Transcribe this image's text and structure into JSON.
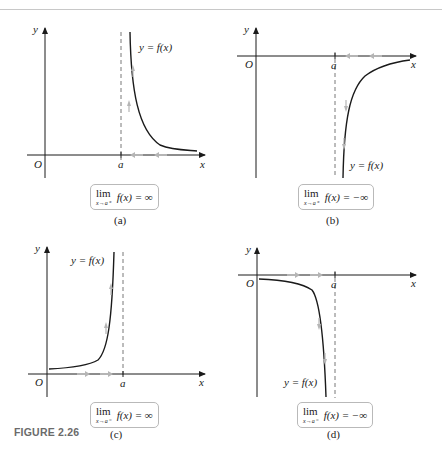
{
  "figure": {
    "label": "FIGURE 2.26",
    "label_color": "#6b6b6b",
    "curve_color": "#1a1a1a",
    "arrow_color": "#b0b0b0",
    "panels": [
      {
        "id": "a",
        "caption": "(a)",
        "y_axis_label": "y",
        "x_axis_label": "x",
        "origin_label": "O",
        "asymptote_label": "a",
        "curve_label": "y = f(x)",
        "limit": {
          "op": "lim",
          "sub": "x→a⁺",
          "expr": "f(x) = ∞"
        },
        "description": "Curve to the right of x=a rising to +∞ as x approaches a from the right"
      },
      {
        "id": "b",
        "caption": "(b)",
        "y_axis_label": "y",
        "x_axis_label": "x",
        "origin_label": "O",
        "asymptote_label": "a",
        "curve_label": "y = f(x)",
        "limit": {
          "op": "lim",
          "sub": "x→a⁺",
          "expr": "f(x) = −∞"
        },
        "description": "Curve to the right of x=a falling to −∞ as x approaches a from the right"
      },
      {
        "id": "c",
        "caption": "(c)",
        "y_axis_label": "y",
        "x_axis_label": "x",
        "origin_label": "O",
        "asymptote_label": "a",
        "curve_label": "y = f(x)",
        "limit": {
          "op": "lim",
          "sub": "x→a⁻",
          "expr": "f(x) = ∞"
        },
        "description": "Curve to the left of x=a rising to +∞ as x approaches a from the left"
      },
      {
        "id": "d",
        "caption": "(d)",
        "y_axis_label": "y",
        "x_axis_label": "x",
        "origin_label": "O",
        "asymptote_label": "a",
        "curve_label": "y = f(x)",
        "limit": {
          "op": "lim",
          "sub": "x→a⁻",
          "expr": "f(x) = −∞"
        },
        "description": "Curve to the left of x=a falling to −∞ as x approaches a from the left"
      }
    ]
  }
}
